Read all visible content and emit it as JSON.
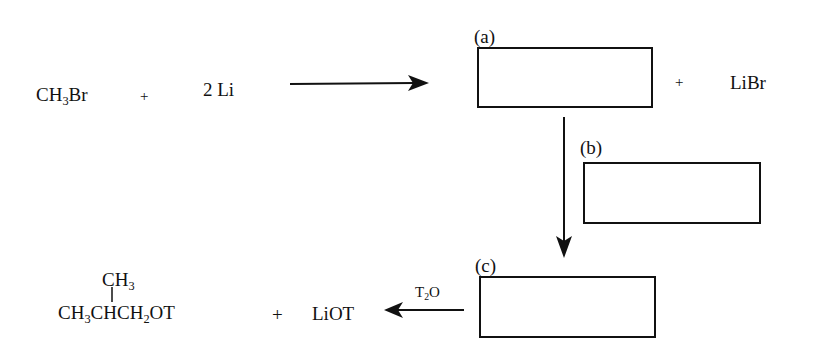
{
  "reaction_scheme": {
    "step1": {
      "reactant1": {
        "main": "CH",
        "sub": "3",
        "tail": "Br"
      },
      "plus": "+",
      "reactant2": "2 Li",
      "arrow": "right",
      "byproduct_plus": "+",
      "byproduct": "LiBr"
    },
    "boxes": [
      {
        "label": "(a)",
        "content": ""
      },
      {
        "label": "(b)",
        "content": ""
      },
      {
        "label": "(c)",
        "content": ""
      }
    ],
    "step_final": {
      "reagent": {
        "main": "T",
        "sub": "2",
        "tail": "O"
      },
      "arrow": "left",
      "product": {
        "branch": {
          "main": "CH",
          "sub": "3"
        },
        "chain": {
          "p1": "CH",
          "s1": "3",
          "p2": "CHCH",
          "s2": "2",
          "p3": "OT"
        }
      },
      "plus": "+",
      "byproduct": "LiOT"
    }
  }
}
